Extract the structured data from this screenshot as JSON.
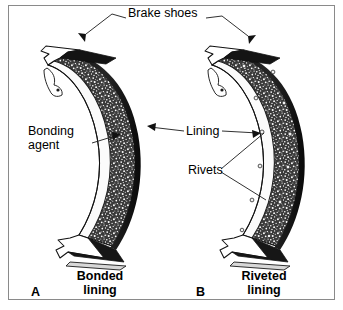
{
  "figure": {
    "background_color": "#ffffff",
    "frame_color": "#8a8a8a",
    "ink_color": "#000000"
  },
  "labels": {
    "brake_shoes": "Brake shoes",
    "bonding_agent_line1": "Bonding",
    "bonding_agent_line2": "agent",
    "lining": "Lining",
    "rivets": "Rivets"
  },
  "captions": [
    {
      "letter": "A",
      "line1": "Bonded",
      "line2": "lining"
    },
    {
      "letter": "B",
      "line1": "Riveted",
      "line2": "lining"
    }
  ]
}
